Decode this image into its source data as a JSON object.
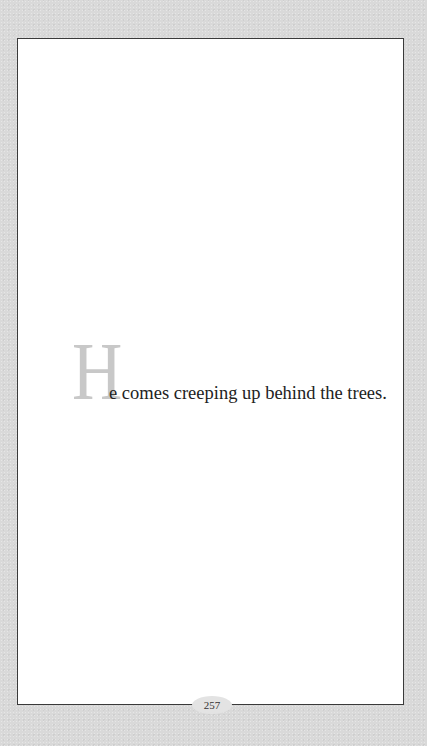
{
  "page": {
    "drop_cap": "H",
    "sentence_rest": "e comes creeping up behind the trees.",
    "page_number": "257"
  }
}
